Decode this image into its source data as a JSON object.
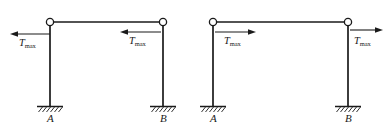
{
  "figure": {
    "type": "structural-free-body-diagram",
    "width": 387,
    "height": 131,
    "line_color": "#1a1a1a",
    "background_color": "#ffffff"
  },
  "frames": [
    {
      "id": "frame-left",
      "beam_y": 22,
      "base_y": 106,
      "left_column_x": 50,
      "right_column_x": 163,
      "joints": [
        {
          "id": "joint-left",
          "cx": 50,
          "cy": 22,
          "r": 3.6,
          "type": "pin"
        },
        {
          "id": "joint-right",
          "cx": 163,
          "cy": 22,
          "r": 3.6,
          "type": "pin"
        }
      ],
      "supports": [
        {
          "id": "support-A",
          "x": 50,
          "y": 106,
          "half_width": 13,
          "label": "A",
          "type": "fixed"
        },
        {
          "id": "support-B",
          "x": 163,
          "y": 106,
          "half_width": 13,
          "label": "B",
          "type": "fixed"
        }
      ],
      "forces": [
        {
          "id": "force-left-outer",
          "label": "T",
          "subscript": "max",
          "direction": "left",
          "tail_x": 50,
          "head_x": 11,
          "y": 34,
          "label_x": 19,
          "label_y": 41
        },
        {
          "id": "force-left-inner",
          "label": "T",
          "subscript": "max",
          "direction": "left",
          "tail_x": 161,
          "head_x": 121,
          "y": 32,
          "label_x": 129,
          "label_y": 39
        }
      ]
    },
    {
      "id": "frame-right",
      "beam_y": 22,
      "base_y": 106,
      "left_column_x": 213,
      "right_column_x": 348,
      "joints": [
        {
          "id": "joint-left",
          "cx": 213,
          "cy": 22,
          "r": 3.6,
          "type": "pin"
        },
        {
          "id": "joint-right",
          "cx": 348,
          "cy": 22,
          "r": 3.6,
          "type": "pin"
        }
      ],
      "supports": [
        {
          "id": "support-A",
          "x": 213,
          "y": 106,
          "half_width": 13,
          "label": "A",
          "type": "fixed"
        },
        {
          "id": "support-B",
          "x": 348,
          "y": 106,
          "half_width": 13,
          "label": "B",
          "type": "fixed"
        }
      ],
      "forces": [
        {
          "id": "force-right-inner",
          "label": "T",
          "subscript": "max",
          "direction": "right",
          "tail_x": 215,
          "head_x": 256,
          "y": 32,
          "label_x": 224,
          "label_y": 40
        },
        {
          "id": "force-right-outer",
          "label": "T",
          "subscript": "max",
          "direction": "right",
          "tail_x": 350,
          "head_x": 383,
          "y": 30,
          "label_x": 354,
          "label_y": 40
        }
      ]
    }
  ],
  "labels": {
    "force_symbol": "T",
    "force_subscript": "max",
    "node_a": "A",
    "node_b": "B"
  }
}
